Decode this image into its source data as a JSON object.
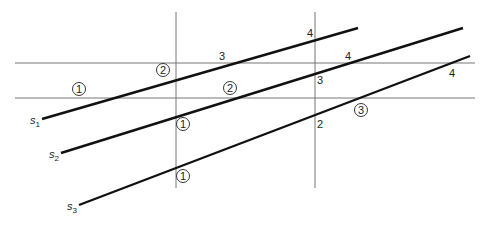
{
  "diagram": {
    "title": "",
    "colors": {
      "line": "#111111",
      "grid": "#777777",
      "background": "#ffffff"
    },
    "grid_lines": {
      "vertical": [
        {
          "id": "v1",
          "x": 176,
          "y1": 12,
          "y2": 188
        },
        {
          "id": "v2",
          "x": 315,
          "y1": 12,
          "y2": 188
        }
      ],
      "horizontal": [
        {
          "id": "h1",
          "y": 63,
          "x1": 15,
          "x2": 475
        },
        {
          "id": "h2",
          "y": 98,
          "x1": 15,
          "x2": 475
        }
      ]
    },
    "series_lines": [
      {
        "id": "s1",
        "label": "s",
        "subscript": "1",
        "x1": 42,
        "y1": 119,
        "x2": 358,
        "y2": 28
      },
      {
        "id": "s2",
        "label": "s",
        "subscript": "2",
        "x1": 61,
        "y1": 153,
        "x2": 463,
        "y2": 28
      },
      {
        "id": "s3",
        "label": "s",
        "subscript": "3",
        "x1": 79,
        "y1": 205,
        "x2": 470,
        "y2": 56
      }
    ],
    "intersection_labels": {
      "s1": [
        {
          "text": "1",
          "circled": true,
          "x": 79,
          "y": 89
        },
        {
          "text": "2",
          "circled": true,
          "x": 163,
          "y": 70
        },
        {
          "text": "3",
          "circled": false,
          "x": 222,
          "y": 58
        },
        {
          "text": "4",
          "circled": false,
          "x": 310,
          "y": 37
        }
      ],
      "s2": [
        {
          "text": "1",
          "circled": true,
          "x": 183,
          "y": 124
        },
        {
          "text": "2",
          "circled": true,
          "x": 230,
          "y": 88
        },
        {
          "text": "3",
          "circled": false,
          "x": 320,
          "y": 81
        },
        {
          "text": "4",
          "circled": false,
          "x": 348,
          "y": 58
        }
      ],
      "s3": [
        {
          "text": "1",
          "circled": true,
          "x": 183,
          "y": 176
        },
        {
          "text": "2",
          "circled": false,
          "x": 320,
          "y": 126
        },
        {
          "text": "3",
          "circled": true,
          "x": 361,
          "y": 110
        },
        {
          "text": "4",
          "circled": false,
          "x": 452,
          "y": 75
        }
      ]
    }
  }
}
